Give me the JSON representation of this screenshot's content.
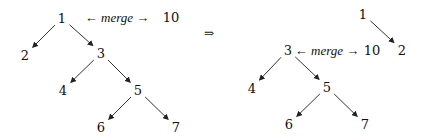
{
  "diagram": {
    "type": "binary-tree-merge",
    "implies_symbol": "⇒",
    "before": {
      "merge_label": {
        "left_arrow": "←",
        "word": "merge",
        "right_arrow": "→"
      },
      "extra_node": "10",
      "nodes": [
        {
          "id": "1",
          "label": "1",
          "x": 62,
          "y": 18
        },
        {
          "id": "2",
          "label": "2",
          "x": 25,
          "y": 55
        },
        {
          "id": "3",
          "label": "3",
          "x": 101,
          "y": 53
        },
        {
          "id": "4",
          "label": "4",
          "x": 63,
          "y": 90
        },
        {
          "id": "5",
          "label": "5",
          "x": 138,
          "y": 90
        },
        {
          "id": "6",
          "label": "6",
          "x": 101,
          "y": 127
        },
        {
          "id": "7",
          "label": "7",
          "x": 176,
          "y": 127
        }
      ],
      "edges": [
        [
          "1",
          "2"
        ],
        [
          "1",
          "3"
        ],
        [
          "3",
          "4"
        ],
        [
          "3",
          "5"
        ],
        [
          "5",
          "6"
        ],
        [
          "5",
          "7"
        ]
      ]
    },
    "after": {
      "merge_label": {
        "left_arrow": "←",
        "word": "merge",
        "right_arrow": "→"
      },
      "extra_node": "10",
      "nodes": [
        {
          "id": "1",
          "label": "1",
          "x": 363,
          "y": 14
        },
        {
          "id": "2",
          "label": "2",
          "x": 402,
          "y": 50
        },
        {
          "id": "3",
          "label": "3",
          "x": 288,
          "y": 50
        },
        {
          "id": "4",
          "label": "4",
          "x": 252,
          "y": 88
        },
        {
          "id": "5",
          "label": "5",
          "x": 327,
          "y": 87
        },
        {
          "id": "6",
          "label": "6",
          "x": 289,
          "y": 124
        },
        {
          "id": "7",
          "label": "7",
          "x": 365,
          "y": 124
        }
      ],
      "edges": [
        [
          "1",
          "2"
        ],
        [
          "3",
          "4"
        ],
        [
          "3",
          "5"
        ],
        [
          "5",
          "6"
        ],
        [
          "5",
          "7"
        ]
      ]
    }
  }
}
